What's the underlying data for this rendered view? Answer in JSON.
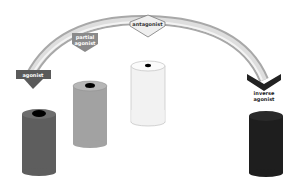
{
  "diagram": {
    "arc": {
      "outer_color": "#a8a8a8",
      "inner_color": "#dedede",
      "highlight_color": "#f4f4f4"
    },
    "markers": [
      {
        "id": "agonist",
        "label": "agonist",
        "fill": "#5a5a5a",
        "text_color": "#ffffff",
        "shape": "down-arrow"
      },
      {
        "id": "partial-agonist",
        "label_line1": "partial",
        "label_line2": "agonist",
        "fill": "#8a8a8a",
        "text_color": "#ffffff",
        "shape": "shield"
      },
      {
        "id": "antagonist",
        "label": "antagonist",
        "fill": "#efefef",
        "text_color": "#333333",
        "shape": "diamond"
      },
      {
        "id": "inverse-agonist",
        "label_line1": "inverse",
        "label_line2": "agonist",
        "fill": "#222222",
        "text_color": "#222222",
        "shape": "chevron"
      }
    ],
    "cylinders": [
      {
        "id": "full-activity",
        "body_color": "#5e5e5e",
        "top_color": "#6e6e6e",
        "pore_color": "#000000",
        "pore": "large"
      },
      {
        "id": "partial-activity",
        "body_color": "#a2a2a2",
        "top_color": "#b6b6b6",
        "pore_color": "#000000",
        "pore": "medium"
      },
      {
        "id": "basal-activity",
        "body_color": "#f2f2f2",
        "top_color": "#fbfbfb",
        "pore_color": "#000000",
        "pore": "small"
      },
      {
        "id": "no-activity",
        "body_color": "#1e1e1e",
        "top_color": "#2a2a2a",
        "pore_color": "none",
        "pore": "none"
      }
    ]
  }
}
